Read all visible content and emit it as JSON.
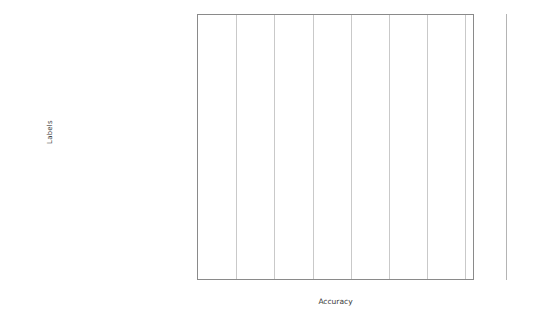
{
  "chart_data": {
    "type": "bar",
    "orientation": "horizontal",
    "title": "",
    "xlabel": "Accuracy",
    "ylabel": "Labels",
    "xlim": [
      0.88,
      1.025
    ],
    "xticks": [
      0.88,
      0.9,
      0.92,
      0.94,
      0.96,
      0.98,
      1,
      1.02
    ],
    "xtick_labels": [
      "0.88",
      "0.9",
      "0.92",
      "0.94",
      "0.96",
      "0.98",
      "1",
      "1.02"
    ],
    "grid": true,
    "legend": "none",
    "bar_color": "#6e6e6e",
    "categories": [
      "benign_mastitis_na",
      "breast_cancer_metastasis_na",
      "breast_ cancer_na_lobular",
      "atypical_phyllodes_na",
      "breast_cancer_invasive_na",
      "benign_radial_scar_na",
      "breast_cancer_na_ductal",
      "atypical_flat_epithelial_atypia_na",
      "breast_cancer_in_situ_lobular",
      "benign_sclerosing_adenosis_na",
      "breast_cancer_invasive_lobular",
      "benign_papilloma_na",
      "atypical_atypical_ductal_hyperplasia_na",
      "benign_pseudoangiomatous_stromal_hyperplasia_na",
      "benign_apocrine_metaplasia_na",
      "atypical_atypical_lobular_hyperplasia_na",
      "benign_usual_ductal_hyperplasia_na",
      "benign_cyst_na",
      "atypical_fibroadenoma_na",
      "breast_cancer_na_na",
      "breast_cancer_in_situ_ductal",
      "breast_cancer_invasive_ductal"
    ],
    "series": [
      {
        "name": "series-1",
        "values": [
          0.9995,
          0.9995,
          1.0,
          1.0,
          0.9995,
          0.9985,
          0.9975,
          0.9955,
          0.9995,
          0.9965,
          1.0,
          0.9965,
          0.9955,
          1.0,
          0.9975,
          0.9965,
          0.9935,
          0.9985,
          0.9975,
          0.9985,
          0.9715,
          0.9755
        ]
      },
      {
        "name": "series-2",
        "values": [
          0.9995,
          0.9995,
          1.0,
          0.9995,
          1.0,
          0.9975,
          0.9955,
          0.9965,
          1.0,
          0.9935,
          0.9945,
          0.9945,
          0.9975,
          0.9995,
          0.9965,
          0.9975,
          0.9955,
          0.9995,
          0.9985,
          1.0,
          0.9985,
          0.9935
        ]
      }
    ]
  }
}
